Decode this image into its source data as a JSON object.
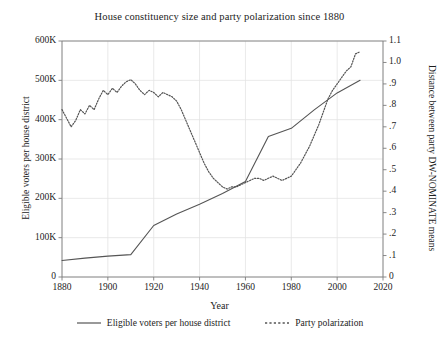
{
  "chart_data": {
    "type": "line",
    "title": "House constituency size and party polarization since 1880",
    "xlabel": "Year",
    "ylabel": "Eligible voters per house district",
    "ylabel_right": "Distance between party DW-NOMINATE means",
    "xlim": [
      1880,
      2020
    ],
    "ylim": [
      0,
      600000
    ],
    "ylim_right": [
      0,
      1.1
    ],
    "grid": true,
    "legend_position": "below",
    "xticks": [
      "1880",
      "1900",
      "1920",
      "1940",
      "1960",
      "1980",
      "2000",
      "2020"
    ],
    "xtick_values": [
      1880,
      1900,
      1920,
      1940,
      1960,
      1980,
      2000,
      2020
    ],
    "yticks_left": [
      "0",
      "100K",
      "200K",
      "300K",
      "400K",
      "500K",
      "600K"
    ],
    "ytick_values_left": [
      0,
      100000,
      200000,
      300000,
      400000,
      500000,
      600000
    ],
    "yticks_right": [
      "0",
      ".1",
      ".2",
      ".3",
      ".4",
      ".5",
      ".6",
      ".7",
      ".8",
      ".9",
      "1.0",
      "1.1"
    ],
    "ytick_values_right": [
      0,
      0.1,
      0.2,
      0.3,
      0.4,
      0.5,
      0.6,
      0.7,
      0.8,
      0.9,
      1.0,
      1.1
    ],
    "series": [
      {
        "name": "Eligible voters per house district",
        "axis": "left",
        "style": "solid",
        "color": "#555555",
        "x": [
          1880,
          1890,
          1900,
          1910,
          1920,
          1930,
          1940,
          1950,
          1960,
          1970,
          1980,
          1990,
          2000,
          2010
        ],
        "values": [
          42000,
          48000,
          53000,
          57000,
          131000,
          160000,
          185000,
          212000,
          243000,
          357000,
          378000,
          425000,
          468000,
          500000
        ]
      },
      {
        "name": "Party polarization",
        "axis": "right",
        "style": "dotted",
        "color": "#555555",
        "x": [
          1880,
          1882,
          1884,
          1886,
          1888,
          1890,
          1892,
          1894,
          1896,
          1898,
          1900,
          1902,
          1904,
          1906,
          1908,
          1910,
          1912,
          1914,
          1916,
          1918,
          1920,
          1922,
          1924,
          1926,
          1928,
          1930,
          1932,
          1934,
          1936,
          1938,
          1940,
          1942,
          1944,
          1946,
          1948,
          1950,
          1952,
          1954,
          1956,
          1958,
          1960,
          1962,
          1964,
          1966,
          1968,
          1970,
          1972,
          1974,
          1976,
          1978,
          1980,
          1982,
          1984,
          1986,
          1988,
          1990,
          1992,
          1994,
          1996,
          1998,
          2000,
          2002,
          2004,
          2006,
          2008,
          2010
        ],
        "values": [
          0.78,
          0.74,
          0.7,
          0.73,
          0.78,
          0.76,
          0.8,
          0.78,
          0.83,
          0.87,
          0.85,
          0.88,
          0.86,
          0.89,
          0.91,
          0.92,
          0.9,
          0.87,
          0.85,
          0.87,
          0.86,
          0.84,
          0.86,
          0.85,
          0.84,
          0.82,
          0.78,
          0.73,
          0.68,
          0.63,
          0.58,
          0.53,
          0.49,
          0.46,
          0.44,
          0.42,
          0.41,
          0.42,
          0.42,
          0.43,
          0.44,
          0.45,
          0.46,
          0.46,
          0.45,
          0.46,
          0.47,
          0.46,
          0.45,
          0.46,
          0.47,
          0.5,
          0.53,
          0.57,
          0.61,
          0.66,
          0.71,
          0.77,
          0.83,
          0.87,
          0.9,
          0.93,
          0.96,
          0.98,
          1.04,
          1.05
        ]
      }
    ]
  },
  "legend": {
    "items": [
      {
        "label": "Eligible voters per house district",
        "style": "solid"
      },
      {
        "label": "Party polarization",
        "style": "dotted"
      }
    ]
  },
  "colors": {
    "line": "#555555",
    "grid": "#e3e3e3",
    "axis": "#7d7d7d",
    "text": "#1c1c1c"
  }
}
